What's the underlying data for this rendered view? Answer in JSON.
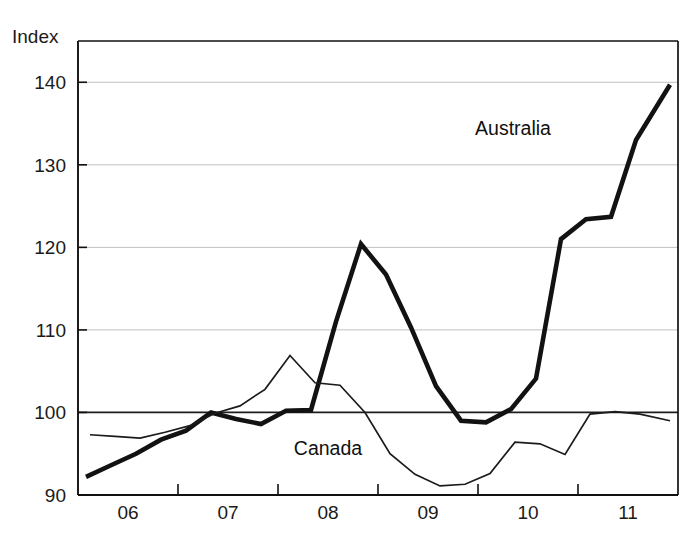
{
  "chart_data": {
    "type": "line",
    "title": "",
    "subtitle": "",
    "xlabel": "",
    "ylabel": "Index",
    "ylim": [
      90,
      145
    ],
    "xlim": [
      2005.5,
      2011.5
    ],
    "grid": true,
    "gridlines_y": [
      100,
      110,
      120,
      130,
      140
    ],
    "baseline_y": 100,
    "ytick_labels": [
      "90",
      "100",
      "110",
      "120",
      "130",
      "140"
    ],
    "ytick_values": [
      90,
      100,
      110,
      120,
      130,
      140
    ],
    "xtick_labels": [
      "06",
      "07",
      "08",
      "09",
      "10",
      "11"
    ],
    "xtick_values": [
      2006,
      2007,
      2008,
      2009,
      2010,
      2011
    ],
    "xtick_boundaries": [
      2006.5,
      2007.5,
      2008.5,
      2009.5,
      2010.5
    ],
    "legend_position": "inline-annotations",
    "series": [
      {
        "name": "Australia",
        "label": "Australia",
        "color": "#121212",
        "line_width": 4.6,
        "annotation": {
          "text": "Australia",
          "x": 2009.85,
          "y": 133.6
        },
        "x": [
          2005.58,
          2005.83,
          2006.08,
          2006.33,
          2006.58,
          2006.83,
          2007.08,
          2007.33,
          2007.58,
          2007.83,
          2008.08,
          2008.33,
          2008.58,
          2008.83,
          2009.08,
          2009.33,
          2009.58,
          2009.83,
          2010.08,
          2010.33,
          2010.58,
          2010.83,
          2011.08,
          2011.42
        ],
        "y": [
          92.2,
          93.6,
          95.0,
          96.7,
          97.8,
          100.0,
          99.2,
          98.6,
          100.2,
          100.3,
          111.0,
          120.4,
          116.7,
          110.3,
          103.2,
          99.0,
          98.8,
          100.4,
          104.1,
          121.0,
          123.4,
          123.7,
          133.0,
          139.7
        ]
      },
      {
        "name": "Canada",
        "label": "Canada",
        "color": "#1b1b1b",
        "line_width": 1.7,
        "annotation": {
          "text": "Canada",
          "x": 2008.0,
          "y": 94.8
        },
        "x": [
          2005.62,
          2005.87,
          2006.12,
          2006.37,
          2006.62,
          2006.87,
          2007.12,
          2007.37,
          2007.62,
          2007.87,
          2008.12,
          2008.37,
          2008.62,
          2008.87,
          2009.12,
          2009.37,
          2009.62,
          2009.87,
          2010.12,
          2010.37,
          2010.62,
          2010.87,
          2011.12,
          2011.42
        ],
        "y": [
          97.3,
          97.1,
          96.9,
          97.6,
          98.4,
          99.9,
          100.8,
          102.8,
          106.9,
          103.6,
          103.3,
          100.0,
          95.0,
          92.5,
          91.1,
          91.3,
          92.6,
          96.4,
          96.2,
          94.9,
          99.8,
          100.1,
          99.8,
          99.0
        ]
      }
    ]
  },
  "axes": {
    "y_axis_title": "Index"
  }
}
